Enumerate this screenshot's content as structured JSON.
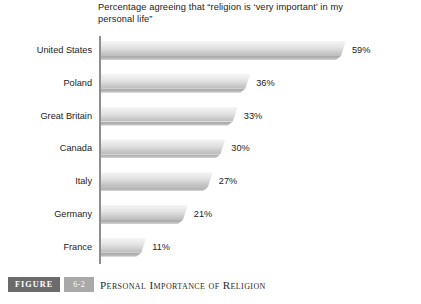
{
  "chart_data": {
    "type": "bar",
    "orientation": "horizontal",
    "title": "Percentage agreeing that “religion is ‘very important’ in my personal life”",
    "title_lines": [
      "Percentage agreeing that “religion is ‘very important’ in my",
      "personal life”"
    ],
    "categories": [
      "United States",
      "Poland",
      "Great Britain",
      "Canada",
      "Italy",
      "Germany",
      "France"
    ],
    "values": [
      59,
      36,
      33,
      30,
      27,
      21,
      11
    ],
    "data_labels": [
      "59%",
      "36%",
      "33%",
      "30%",
      "27%",
      "21%",
      "11%"
    ],
    "xlabel": "",
    "ylabel": "",
    "xlim": [
      0,
      65
    ],
    "grid": false,
    "legend": false,
    "unit": "%"
  },
  "caption": {
    "figure_label": "FIGURE",
    "figure_number": "6-2",
    "title": "Personal Importance of Religion"
  },
  "colors": {
    "bar_light": "#f4f4f4",
    "bar_dark": "#bdbdbd",
    "bar_shadow": "#a9a9a9",
    "axis": "#8e8e8e",
    "text": "#1b1b1b",
    "figure_badge": "#6b6b6b",
    "number_badge": "#a8a8a8"
  }
}
